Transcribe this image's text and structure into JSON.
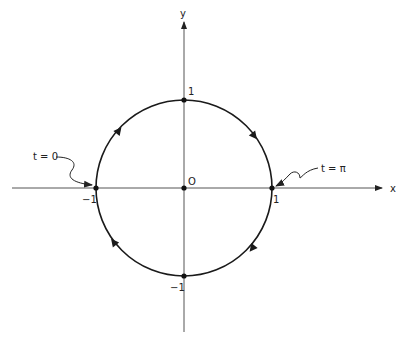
{
  "diagram": {
    "type": "unit-circle-parametrization",
    "axes": {
      "x_label": "x",
      "y_label": "y",
      "origin_label": "O"
    },
    "ticks": {
      "x_pos": "1",
      "x_neg": "−1",
      "y_pos": "1",
      "y_neg": "−1"
    },
    "annotations": [
      {
        "id": "start",
        "text": "t = 0",
        "points_to": "(-1, 0)"
      },
      {
        "id": "half",
        "text": "t = π",
        "points_to": "(1, 0)"
      }
    ],
    "direction": "clockwise",
    "colors": {
      "stroke": "#1a1a1a",
      "axis": "#444444",
      "background": "#ffffff"
    }
  }
}
